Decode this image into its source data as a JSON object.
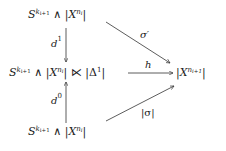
{
  "diagram": {
    "type": "commutative-diagram",
    "nodes": {
      "top": {
        "base": "S",
        "exp_base": "k",
        "exp_sub": "i+1",
        "wedge": "∧",
        "X": "X",
        "X_exp": "n",
        "X_sub": "i"
      },
      "middle": {
        "base": "S",
        "exp_base": "k",
        "exp_sub": "i+1",
        "wedge": "∧",
        "X": "X",
        "X_exp": "n",
        "X_sub": "i",
        "ltimes": "⋉",
        "delta": "Δ",
        "delta_exp": "1"
      },
      "right": {
        "X": "X",
        "X_exp": "n",
        "X_sub": "i+1"
      },
      "bottom": {
        "base": "S",
        "exp_base": "k",
        "exp_sub": "i+1",
        "wedge": "∧",
        "X": "X",
        "X_exp": "n",
        "X_sub": "i"
      }
    },
    "arrows": {
      "d1": {
        "label": "d",
        "sup": "1",
        "from": "top",
        "to": "middle"
      },
      "d0": {
        "label": "d",
        "sup": "0",
        "from": "bottom",
        "to": "middle"
      },
      "h": {
        "label": "h",
        "from": "middle",
        "to": "right"
      },
      "sigma_prime": {
        "label": "σ′",
        "from": "top",
        "to": "right"
      },
      "abs_sigma": {
        "label": "|σ|",
        "from": "bottom",
        "to": "right"
      }
    }
  }
}
